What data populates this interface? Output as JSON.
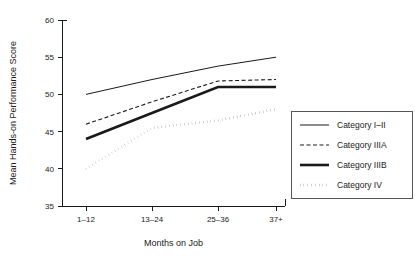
{
  "chart_data": {
    "type": "line",
    "title": "",
    "xlabel": "Months on Job",
    "ylabel": "Mean Hands-on Performance Score",
    "categories": [
      "1–12",
      "13–24",
      "25–36",
      "37+"
    ],
    "ylim": [
      35,
      60
    ],
    "yticks": [
      35,
      40,
      45,
      50,
      55,
      60
    ],
    "ytick_labels": [
      "35",
      "40",
      "45",
      "50",
      "55",
      "60"
    ],
    "grid": false,
    "legend_position": "right",
    "series": [
      {
        "name": "Category I–II",
        "values": [
          50.0,
          52.0,
          53.8,
          55.0
        ],
        "style": "solid-thin",
        "color": "#1a1a1a",
        "width": 1.0,
        "dash": "none"
      },
      {
        "name": "Category IIIA",
        "values": [
          46.0,
          49.0,
          51.8,
          52.0
        ],
        "style": "dashed-thin",
        "color": "#1a1a1a",
        "width": 1.1,
        "dash": "4,2.5"
      },
      {
        "name": "Category IIIB",
        "values": [
          44.0,
          47.5,
          51.0,
          51.0
        ],
        "style": "solid-thick",
        "color": "#1a1a1a",
        "width": 2.6,
        "dash": "none"
      },
      {
        "name": "Category IV",
        "values": [
          40.0,
          45.5,
          46.5,
          48.0
        ],
        "style": "dotted-thick",
        "color": "#1a1a1a",
        "width": 2.4,
        "dash": "0.2,3.6"
      }
    ]
  },
  "legend": {
    "items": [
      {
        "label": "Category I–II"
      },
      {
        "label": "Category IIIA"
      },
      {
        "label": "Category IIIB"
      },
      {
        "label": "Category IV"
      }
    ]
  },
  "colors": {
    "ink": "#1a1a1a",
    "background": "#ffffff",
    "legend_border": "#555555"
  }
}
